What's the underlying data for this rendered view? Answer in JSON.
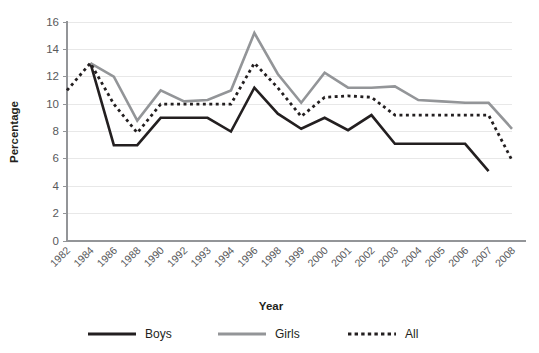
{
  "chart_data": {
    "type": "line",
    "title": "",
    "xlabel": "Year",
    "ylabel": "Percentage",
    "ylim": [
      0,
      16
    ],
    "ytick_step": 2,
    "yticks": [
      "0",
      "2",
      "4",
      "6",
      "8",
      "10",
      "12",
      "14",
      "16"
    ],
    "grid": true,
    "legend_position": "bottom",
    "categories": [
      "1982",
      "1984",
      "1986",
      "1988",
      "1990",
      "1992",
      "1993",
      "1994",
      "1996",
      "1998",
      "1999",
      "2000",
      "2001",
      "2002",
      "2003",
      "2004",
      "2005",
      "2006",
      "2007",
      "2008"
    ],
    "series": [
      {
        "name": "Boys",
        "color": "#231f20",
        "style": "solid",
        "width": 2.6,
        "values": [
          null,
          13.0,
          7.0,
          7.0,
          9.0,
          9.0,
          9.0,
          8.0,
          11.2,
          9.3,
          8.2,
          9.0,
          8.1,
          9.2,
          7.1,
          7.1,
          7.1,
          7.1,
          5.1,
          null
        ]
      },
      {
        "name": "Girls",
        "color": "#939598",
        "style": "solid",
        "width": 2.6,
        "values": [
          null,
          13.0,
          12.0,
          8.8,
          11.0,
          10.2,
          10.3,
          11.0,
          15.2,
          12.2,
          10.1,
          12.3,
          11.2,
          11.2,
          11.3,
          10.3,
          10.2,
          10.1,
          10.1,
          8.2
        ]
      },
      {
        "name": "All",
        "color": "#231f20",
        "style": "dotted",
        "width": 2.8,
        "values": [
          11.0,
          13.0,
          10.0,
          7.9,
          10.0,
          10.0,
          10.0,
          10.0,
          13.0,
          11.2,
          9.1,
          10.5,
          10.6,
          10.5,
          9.2,
          9.2,
          9.2,
          9.2,
          9.2,
          5.9
        ]
      }
    ],
    "legend": [
      {
        "label": "Boys",
        "color": "#231f20",
        "style": "solid"
      },
      {
        "label": "Girls",
        "color": "#939598",
        "style": "solid"
      },
      {
        "label": "All",
        "color": "#231f20",
        "style": "dotted"
      }
    ]
  }
}
